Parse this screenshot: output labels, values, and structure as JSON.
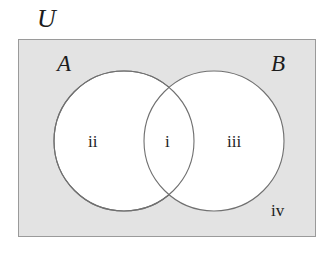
{
  "diagram": {
    "type": "venn-two-set",
    "title_label": "U",
    "universe": {
      "name": "universal-set",
      "label": "U",
      "fill_color": "#e3e3e3",
      "border_color": "#9a9a9a"
    },
    "sets": [
      {
        "id": "A",
        "label": "A",
        "fill_color": "#ffffff",
        "stroke_color": "#707070",
        "cx": 124,
        "cy": 141,
        "r": 70
      },
      {
        "id": "B",
        "label": "B",
        "fill_color": "#ffffff",
        "stroke_color": "#707070",
        "cx": 214,
        "cy": 141,
        "r": 70
      }
    ],
    "regions": [
      {
        "id": "i",
        "label": "i",
        "meaning": "A-intersect-B"
      },
      {
        "id": "ii",
        "label": "ii",
        "meaning": "A-only"
      },
      {
        "id": "iii",
        "label": "iii",
        "meaning": "B-only"
      },
      {
        "id": "iv",
        "label": "iv",
        "meaning": "outside-both"
      }
    ]
  }
}
